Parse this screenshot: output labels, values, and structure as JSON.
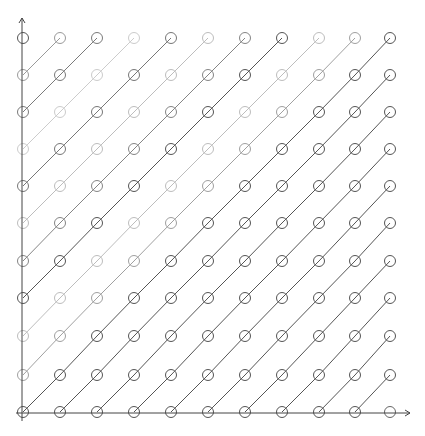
{
  "diagram": {
    "type": "lattice-diagonals",
    "grid": {
      "cols": 11,
      "rows": 11,
      "x_positions": [
        23,
        60,
        97,
        134,
        171,
        208,
        245,
        282,
        319,
        355,
        390
      ],
      "y_positions_bottom_up": [
        412,
        375,
        336,
        298,
        261,
        223,
        186,
        149,
        112,
        75,
        38
      ],
      "circle_radius": 5.5
    },
    "axes": {
      "origin": [
        22,
        413
      ],
      "x_axis_end": [
        410,
        413
      ],
      "y_axis_end": [
        22,
        18
      ],
      "color": "#444444"
    },
    "diagonal_colors": {
      "-10": "#555555",
      "-9": "#9a9a9a",
      "-8": "#7a7a7a",
      "-7": "#cccccc",
      "-6": "#777777",
      "-5": "#bdbdbd",
      "-4": "#858585",
      "-3": "#555555",
      "-2": "#bdbdbd",
      "-1": "#a0a0a0",
      "0": "#555555",
      "1": "#555555",
      "2": "#555555",
      "3": "#555555",
      "4": "#555555",
      "5": "#555555",
      "6": "#555555",
      "7": "#555555",
      "8": "#555555",
      "9": "#555555",
      "10": "#666666"
    }
  }
}
